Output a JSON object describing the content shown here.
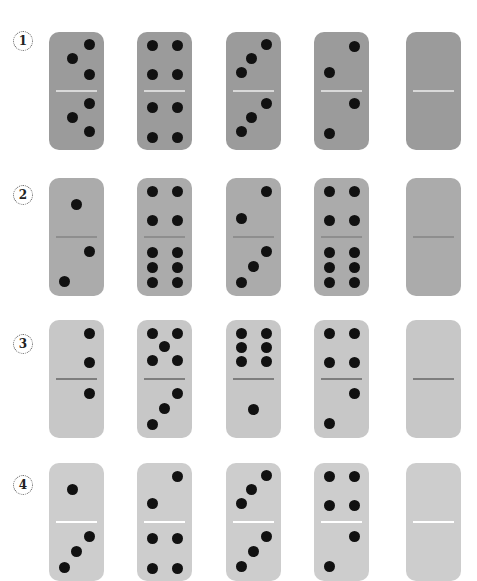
{
  "worksheet": {
    "rows": [
      {
        "label": "1",
        "label_y": 31,
        "top": 32,
        "color": "#9b9b9b",
        "divider_color": "#d9d9d9",
        "dominoes": [
          {
            "top": 3,
            "bottom": 3
          },
          {
            "top": 4,
            "bottom": 4
          },
          {
            "top": 3,
            "bottom": 3
          },
          {
            "top": 2,
            "bottom": 2
          },
          {
            "top": 0,
            "bottom": 0,
            "blank": true
          }
        ]
      },
      {
        "label": "2",
        "label_y": 185,
        "top": 178,
        "color": "#ababab",
        "divider_color": "#8e8e8e",
        "dominoes": [
          {
            "top": 1,
            "bottom": 2
          },
          {
            "top": 4,
            "bottom": 6
          },
          {
            "top": 2,
            "bottom": 3
          },
          {
            "top": 4,
            "bottom": 6
          },
          {
            "top": 0,
            "bottom": 0,
            "blank": true
          }
        ]
      },
      {
        "label": "3",
        "label_y": 334,
        "top": 320,
        "color": "#c7c7c7",
        "divider_color": "#7e7e7e",
        "dominoes": [
          {
            "top": 2,
            "bottom": 1
          },
          {
            "top": 5,
            "bottom": 3
          },
          {
            "top": 6,
            "bottom": 1
          },
          {
            "top": 4,
            "bottom": 2
          },
          {
            "top": 0,
            "bottom": 0,
            "blank": true
          }
        ]
      },
      {
        "label": "4",
        "label_y": 475,
        "top": 463,
        "color": "#cdcdcd",
        "divider_color": "#ffffff",
        "dominoes": [
          {
            "top": 1,
            "bottom": 3
          },
          {
            "top": 2,
            "bottom": 4
          },
          {
            "top": 3,
            "bottom": 3
          },
          {
            "top": 4,
            "bottom": 2
          },
          {
            "top": 0,
            "bottom": 0,
            "blank": true
          }
        ]
      }
    ],
    "column_x": [
      49,
      137,
      226,
      314,
      406
    ]
  }
}
